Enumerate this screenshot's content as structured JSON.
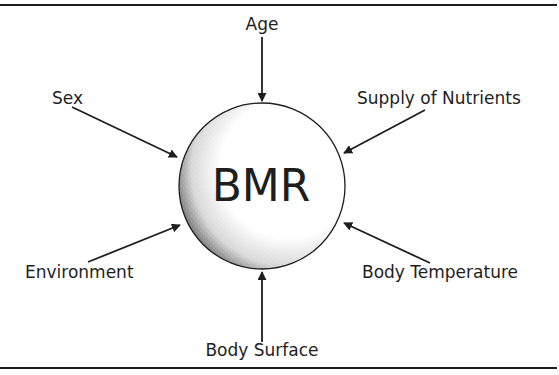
{
  "diagram": {
    "center": {
      "label": "BMR"
    },
    "factors": [
      {
        "id": "age",
        "label": "Age"
      },
      {
        "id": "sex",
        "label": "Sex"
      },
      {
        "id": "supply-of-nutrients",
        "label": "Supply of Nutrients"
      },
      {
        "id": "environment",
        "label": "Environment"
      },
      {
        "id": "body-temperature",
        "label": "Body Temperature"
      },
      {
        "id": "body-surface",
        "label": "Body Surface"
      }
    ],
    "colors": {
      "ink": "#1e1e1e",
      "background": "#ffffff"
    }
  }
}
